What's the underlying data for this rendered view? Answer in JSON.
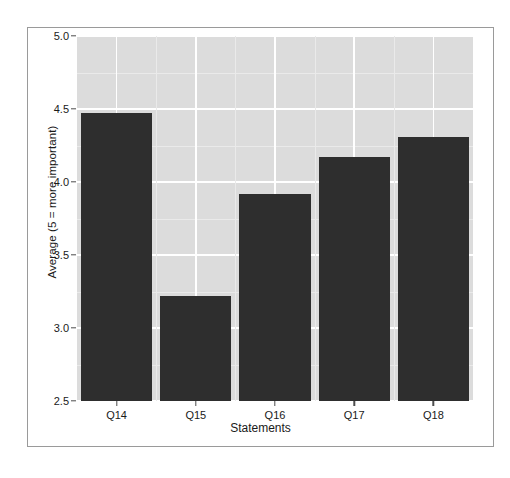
{
  "chart_data": {
    "type": "bar",
    "title": "",
    "subtitle": "",
    "xlabel": "Statements",
    "ylabel": "Average (5 = more important)",
    "categories": [
      "Q14",
      "Q15",
      "Q16",
      "Q17",
      "Q18"
    ],
    "values": [
      4.47,
      3.22,
      3.92,
      4.17,
      4.31
    ],
    "series": [
      {
        "name": "Average rating",
        "values": [
          4.47,
          3.22,
          3.92,
          4.17,
          4.31
        ]
      }
    ],
    "ylim": [
      2.5,
      5.0
    ],
    "ytick_labels": [
      "2.5",
      "3.0",
      "3.5",
      "4.0",
      "4.5",
      "5.0"
    ],
    "ytick_values": [
      2.5,
      3.0,
      3.5,
      4.0,
      4.5,
      5.0
    ],
    "xtick_labels": [
      "Q14",
      "Q15",
      "Q16",
      "Q17",
      "Q18"
    ],
    "grid": true,
    "legend": "none",
    "colors": {
      "bar": "#2e2e2e",
      "panel_background": "#dcdcdc",
      "major_gridline": "#ffffff",
      "minor_gridline": "#eaeaea",
      "axis_text": "#1a1a1a",
      "frame_border": "#9a9a9a",
      "page_background": "#ffffff"
    }
  }
}
